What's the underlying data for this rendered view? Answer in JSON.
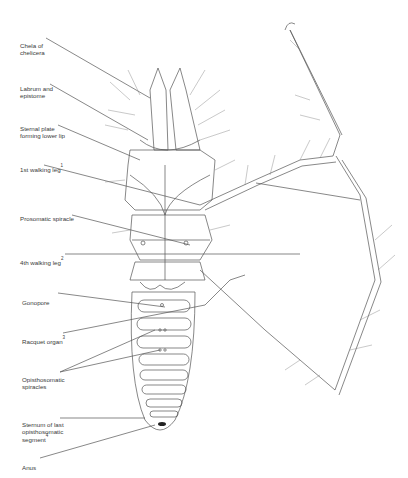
{
  "figure": {
    "labels": [
      {
        "id": "chela",
        "text": "Chela of\nchelicera",
        "sup": ""
      },
      {
        "id": "labrum",
        "text": "Labrum and\nepistome",
        "sup": ""
      },
      {
        "id": "sternal",
        "text": "Sternal plate\nforming lower lip",
        "sup": ""
      },
      {
        "id": "leg1",
        "text": "1st walking leg",
        "sup": "1"
      },
      {
        "id": "prosomatic",
        "text": "Prosomatic spiracle",
        "sup": ""
      },
      {
        "id": "leg4",
        "text": "4th walking leg",
        "sup": "2"
      },
      {
        "id": "gonopore",
        "text": "Gonopore",
        "sup": ""
      },
      {
        "id": "racquet",
        "text": "Racquet organ",
        "sup": "3"
      },
      {
        "id": "opisthosomatic",
        "text": "Opisthosomatic\nspiracles",
        "sup": ""
      },
      {
        "id": "sternum",
        "text": "Sternum of last\nopisthosomatic\nsegment",
        "sup": "4"
      },
      {
        "id": "anus",
        "text": "Anus",
        "sup": ""
      }
    ],
    "caption": "(caption text cut off at bottom edge — illegible)"
  },
  "colors": {
    "line": "#555555",
    "background": "#ffffff",
    "label": "#3a3a3a"
  }
}
